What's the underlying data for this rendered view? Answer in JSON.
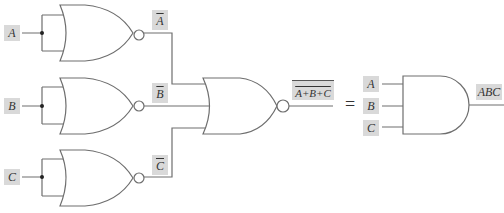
{
  "diagram": {
    "inputs": [
      {
        "label": "A",
        "inverted_label": "A"
      },
      {
        "label": "B",
        "inverted_label": "B"
      },
      {
        "label": "C",
        "inverted_label": "C"
      }
    ],
    "nor_output_label": "A+B+C",
    "equals": "=",
    "and_inputs": [
      "A",
      "B",
      "C"
    ],
    "and_output_label": "ABC",
    "colors": {
      "wire": "#6e6e6e",
      "label_bg": "#d9d9d9"
    }
  }
}
